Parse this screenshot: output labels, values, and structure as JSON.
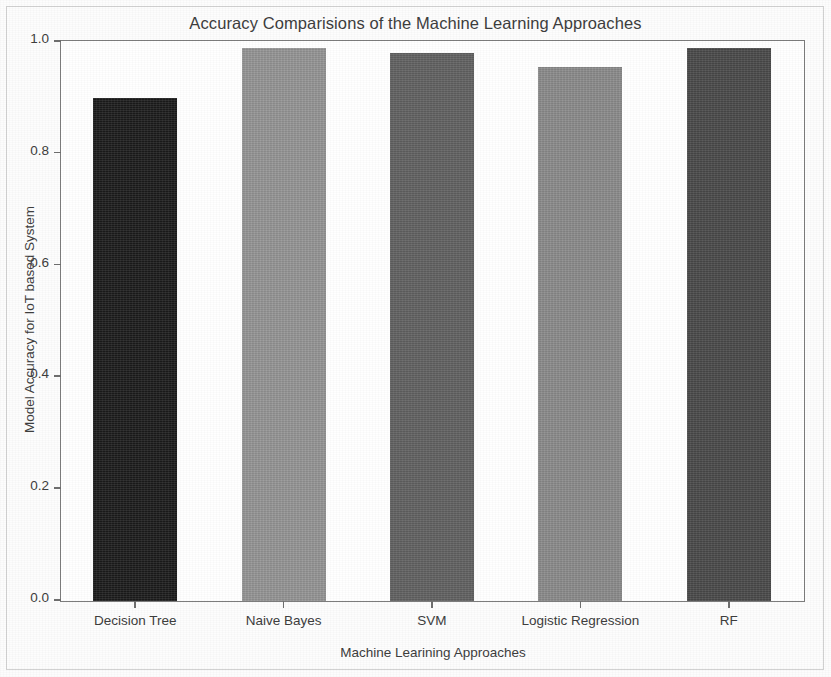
{
  "chart_data": {
    "type": "bar",
    "title": "Accuracy Comparisions of the Machine Learning Approaches",
    "xlabel": "Machine Learining Approaches",
    "ylabel": "Model Accuracy for IoT based System",
    "categories": [
      "Decision Tree",
      "Naive Bayes",
      "SVM",
      "Logistic Regression",
      "RF"
    ],
    "values": [
      0.9,
      0.99,
      0.98,
      0.955,
      0.99
    ],
    "bar_colors": [
      "#1c1c1c",
      "#969696",
      "#626262",
      "#8c8c8c",
      "#4a4a4a"
    ],
    "ylim": [
      0.0,
      1.0
    ],
    "yticks": [
      0.0,
      0.2,
      0.4,
      0.6,
      0.8,
      1.0
    ],
    "ytick_labels": [
      "0.0",
      "0.2",
      "0.4",
      "0.6",
      "0.8",
      "1.0"
    ],
    "grid": false,
    "legend": "none",
    "axis_color": "#7d7d7d",
    "text_color": "#3e3e3e"
  }
}
